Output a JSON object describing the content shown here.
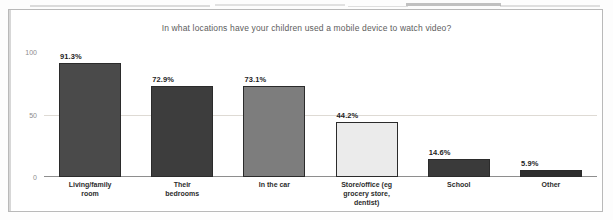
{
  "chart_data": {
    "type": "bar",
    "title": "In what locations have your children used a mobile device to watch video?",
    "xlabel": "",
    "ylabel": "",
    "ylim": [
      0,
      100
    ],
    "yticks": [
      "100",
      "50",
      "0"
    ],
    "grid": true,
    "legend": "none",
    "categories": [
      "Living/family room",
      "Their bedrooms",
      "In the car",
      "Store/office (eg grocery store, dentist)",
      "School",
      "Other"
    ],
    "category_lines": [
      [
        "Living/family",
        "room"
      ],
      [
        "Their",
        "bedrooms"
      ],
      [
        "In the car"
      ],
      [
        "Store/office (eg",
        "grocery store,",
        "dentist)"
      ],
      [
        "School"
      ],
      [
        "Other"
      ]
    ],
    "values": [
      91.3,
      72.9,
      73.1,
      44.2,
      14.6,
      5.9
    ],
    "value_labels": [
      "91.3%",
      "72.9%",
      "73.1%",
      "44.2%",
      "14.6%",
      "5.9%"
    ],
    "bar_colors": [
      "#4a4a4a",
      "#3d3d3d",
      "#7d7d7d",
      "#ebebeb",
      "#3a3a3a",
      "#2e2e2e"
    ]
  }
}
